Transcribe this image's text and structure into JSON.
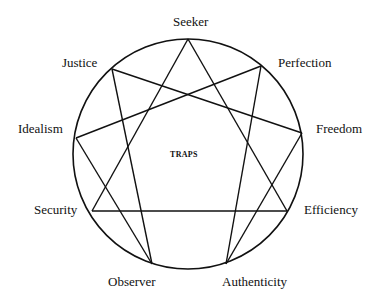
{
  "diagram": {
    "type": "enneagram",
    "center_label": "TRAPS",
    "circle": {
      "cx": 188,
      "cy": 154,
      "r": 115
    },
    "points": [
      {
        "id": "seeker",
        "label": "Seeker",
        "x": 188,
        "y": 39
      },
      {
        "id": "perfection",
        "label": "Perfection",
        "x": 261,
        "y": 66
      },
      {
        "id": "freedom",
        "label": "Freedom",
        "x": 302,
        "y": 133
      },
      {
        "id": "efficiency",
        "label": "Efficiency",
        "x": 287,
        "y": 211
      },
      {
        "id": "authenticity",
        "label": "Authenticity",
        "x": 226,
        "y": 264
      },
      {
        "id": "observer",
        "label": "Observer",
        "x": 152,
        "y": 264
      },
      {
        "id": "security",
        "label": "Security",
        "x": 92,
        "y": 211
      },
      {
        "id": "idealism",
        "label": "Idealism",
        "x": 76,
        "y": 138
      },
      {
        "id": "justice",
        "label": "Justice",
        "x": 112,
        "y": 69
      }
    ],
    "edges": [
      [
        "seeker",
        "security"
      ],
      [
        "seeker",
        "efficiency"
      ],
      [
        "security",
        "efficiency"
      ],
      [
        "justice",
        "freedom"
      ],
      [
        "justice",
        "observer"
      ],
      [
        "perfection",
        "idealism"
      ],
      [
        "perfection",
        "authenticity"
      ],
      [
        "idealism",
        "observer"
      ],
      [
        "freedom",
        "authenticity"
      ]
    ]
  }
}
